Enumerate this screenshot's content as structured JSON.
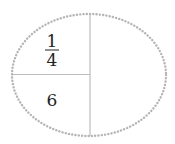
{
  "diagram": {
    "type": "partitioned-oval",
    "regions": {
      "top_left": {
        "kind": "fraction",
        "numerator": "1",
        "denominator": "4"
      },
      "bottom_left": {
        "kind": "value",
        "text": "6"
      },
      "right": {
        "kind": "empty",
        "text": ""
      }
    },
    "colors": {
      "outline": "#b5b5b5",
      "divider": "#bdbdbd",
      "text": "#222222"
    }
  }
}
